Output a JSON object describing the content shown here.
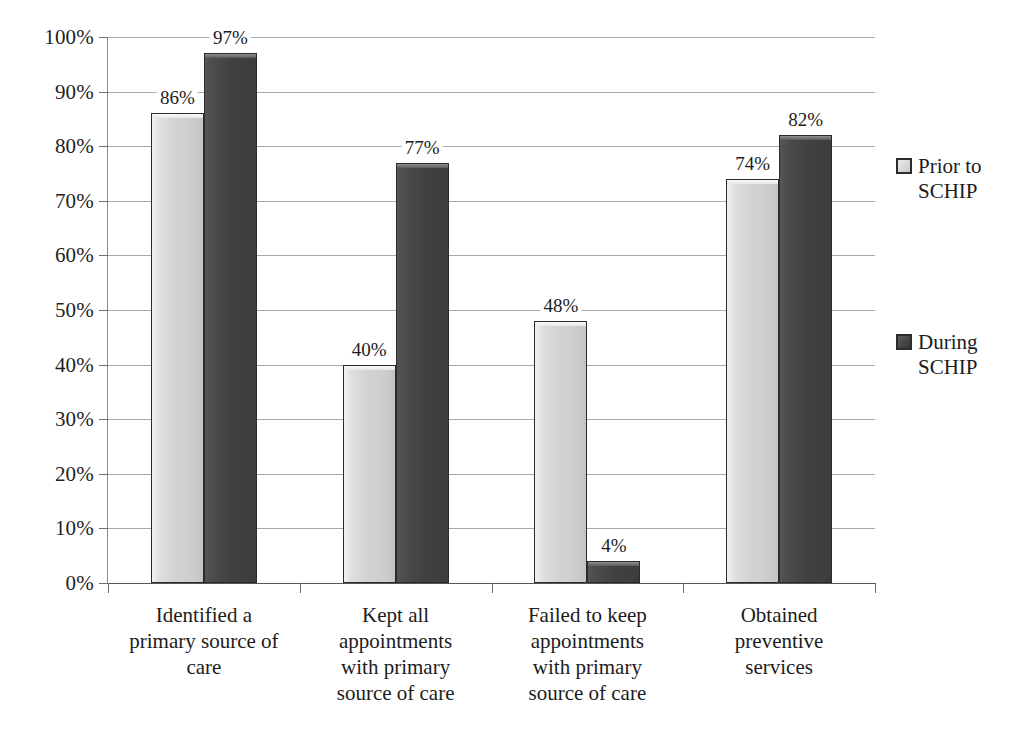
{
  "chart_data": {
    "type": "bar",
    "title": "",
    "subtitle": "",
    "xlabel": "",
    "ylabel": "",
    "ylim": [
      0,
      100
    ],
    "grid": true,
    "legend_position": "right",
    "value_suffix": "%",
    "categories": [
      "Identified a primary source of care",
      "Kept all appointments with primary source of care",
      "Failed to keep appointments with primary source of care",
      "Obtained preventive services"
    ],
    "series": [
      {
        "name": "Prior to SCHIP",
        "color": "#d4d4d4",
        "values": [
          86,
          40,
          48,
          74
        ]
      },
      {
        "name": "During SCHIP",
        "color": "#434343",
        "values": [
          97,
          77,
          4,
          82
        ]
      }
    ],
    "value_labels": [
      [
        "86%",
        "97%"
      ],
      [
        "40%",
        "77%"
      ],
      [
        "48%",
        "4%"
      ],
      [
        "74%",
        "82%"
      ]
    ],
    "ytick_labels": [
      "0%",
      "10%",
      "20%",
      "30%",
      "40%",
      "50%",
      "60%",
      "70%",
      "80%",
      "90%",
      "100%"
    ],
    "ytick_values": [
      0,
      10,
      20,
      30,
      40,
      50,
      60,
      70,
      80,
      90,
      100
    ]
  },
  "axis": {
    "y": {
      "labels": [
        "100%",
        "90%",
        "80%",
        "70%",
        "60%",
        "50%",
        "40%",
        "30%",
        "20%",
        "10%",
        "0%"
      ]
    },
    "x": {
      "labels": [
        "Identified a\nprimary source of\ncare",
        "Kept all\nappointments\nwith primary\nsource of care",
        "Failed to keep\nappointments\nwith primary\nsource of care",
        "Obtained\npreventive\nservices"
      ]
    }
  },
  "legend": {
    "items": [
      {
        "label": "Prior to\nSCHIP",
        "swatch": "light-gray-swatch-icon"
      },
      {
        "label": "During\nSCHIP",
        "swatch": "dark-gray-swatch-icon"
      }
    ]
  },
  "colors": {
    "series_light": "#d4d4d4",
    "series_dark": "#434343",
    "gridline": "#9a9a9a",
    "axis": "#6f6f6f",
    "text": "#1c1c1c",
    "background": "#ffffff"
  }
}
